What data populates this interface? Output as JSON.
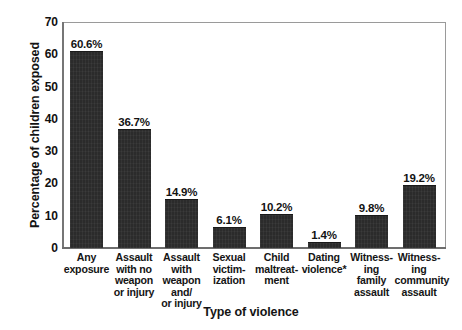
{
  "chart_data": {
    "type": "bar",
    "title": "",
    "xlabel": "Type of violence",
    "ylabel": "Percentage of children exposed",
    "ylim": [
      0,
      70
    ],
    "ytick_step": 10,
    "yticks": [
      "70",
      "60",
      "50",
      "40",
      "30",
      "20",
      "10",
      "0"
    ],
    "grid": false,
    "legend": null,
    "bar_color": "#2b2b2b",
    "categories": [
      "Any exposure",
      "Assault with no weapon or injury",
      "Assault with weapon and/or injury",
      "Sexual victimization",
      "Child maltreatment",
      "Dating violence*",
      "Witnessing family assault",
      "Witnessing community assault"
    ],
    "category_label_lines": [
      [
        "Any",
        "exposure"
      ],
      [
        "Assault",
        "with no",
        "weapon",
        "or injury"
      ],
      [
        "Assault",
        "with",
        "weapon",
        "and/",
        "or injury"
      ],
      [
        "Sexual",
        "victim-",
        "ization"
      ],
      [
        "Child",
        "maltreat-",
        "ment"
      ],
      [
        "Dating",
        "violence*"
      ],
      [
        "Witness-",
        "ing",
        "family",
        "assault"
      ],
      [
        "Witness-",
        "ing",
        "community",
        "assault"
      ]
    ],
    "values": [
      60.6,
      36.7,
      14.9,
      6.1,
      10.2,
      1.4,
      9.8,
      19.2
    ],
    "value_labels": [
      "60.6%",
      "36.7%",
      "14.9%",
      "6.1%",
      "10.2%",
      "1.4%",
      "9.8%",
      "19.2%"
    ]
  }
}
